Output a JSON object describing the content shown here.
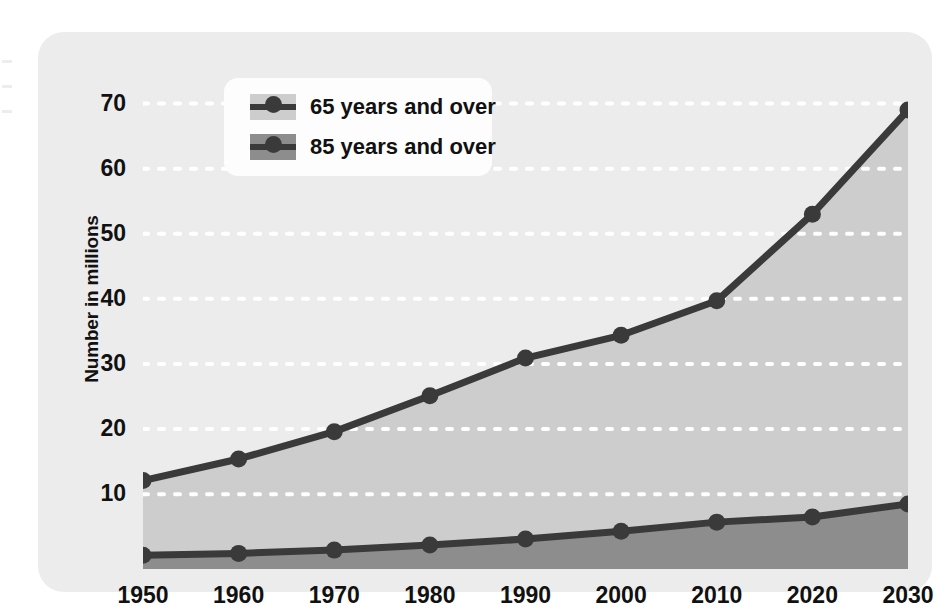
{
  "chart_data": {
    "type": "area",
    "title": "",
    "subtitle": "",
    "xlabel": "",
    "ylabel": "Number in millions",
    "x": [
      1950,
      1960,
      1970,
      1980,
      1990,
      2000,
      2010,
      2020,
      2030
    ],
    "categories": [
      "1950",
      "1960",
      "1970",
      "1980",
      "1990",
      "2000",
      "2010",
      "2020",
      "2030"
    ],
    "series": [
      {
        "name": "65 years and over",
        "values": [
          12.1,
          15.4,
          19.6,
          25.1,
          30.9,
          34.4,
          39.7,
          53.0,
          69.0
        ],
        "fill_color": "#cdcdcd",
        "line_color": "#3a3a3a"
      },
      {
        "name": "85 years and over",
        "values": [
          0.6,
          0.9,
          1.4,
          2.2,
          3.1,
          4.3,
          5.7,
          6.5,
          8.5
        ],
        "fill_color": "#8d8d8d",
        "line_color": "#3a3a3a"
      }
    ],
    "ylim": [
      -1.5,
      73
    ],
    "xlim": [
      1950,
      2030
    ],
    "yticks": [
      10,
      20,
      30,
      40,
      50,
      60,
      70
    ],
    "ytick_labels": [
      "10",
      "20",
      "30",
      "40",
      "50",
      "60",
      "70"
    ],
    "grid": true,
    "grid_style": "dotted-white-horizontal",
    "legend_position": "top-left-inside",
    "panel_color": "#ececec",
    "legend_background": "#fdfdfd"
  },
  "legend": {
    "items": [
      {
        "label": "65 years and over"
      },
      {
        "label": "85 years and over"
      }
    ]
  },
  "axes": {
    "y_label": "Number in millions",
    "y_ticks": [
      "70",
      "60",
      "50",
      "40",
      "30",
      "20",
      "10"
    ],
    "x_ticks": [
      "1950",
      "1960",
      "1970",
      "1980",
      "1990",
      "2000",
      "2010",
      "2020",
      "2030"
    ]
  }
}
